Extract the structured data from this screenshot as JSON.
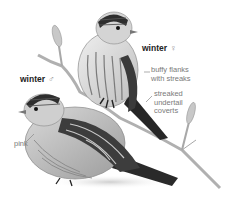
{
  "illustration": {
    "subject": "redpoll",
    "colors": {
      "background": "#ffffff",
      "branch": "#b8b8b8",
      "bird_dark": "#2a2a2a",
      "bird_mid": "#8a8a8a",
      "bird_light": "#e4e4e4",
      "label_text": "#6a6a6a",
      "title_text": "#222222"
    }
  },
  "labels": {
    "female": {
      "text": "winter",
      "symbol": "♀"
    },
    "male": {
      "text": "winter",
      "symbol": "♂"
    },
    "callouts": [
      {
        "line1": "buffy flanks",
        "line2": "with streaks"
      },
      {
        "line1": "streaked",
        "line2": "undertail",
        "line3": "coverts"
      },
      {
        "line1": "pink"
      }
    ]
  }
}
